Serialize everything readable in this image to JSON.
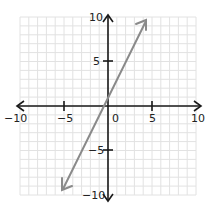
{
  "chart_data": {
    "type": "line",
    "title": "",
    "xlabel": "",
    "ylabel": "",
    "xlim": [
      -10,
      10
    ],
    "ylim": [
      -10,
      10
    ],
    "grid": true,
    "x_ticks": [
      -10,
      -5,
      0,
      5,
      10
    ],
    "y_ticks": [
      -10,
      -5,
      5,
      10
    ],
    "x_tick_labels": [
      "-10",
      "-5",
      "0",
      "5",
      "10"
    ],
    "y_tick_labels": [
      "10",
      "5",
      "-5",
      "-10"
    ],
    "series": [
      {
        "name": "y = 2x + 1",
        "equation": "y = 2x + 1",
        "x": [
          -5.2,
          -0.5,
          0,
          4.4
        ],
        "y": [
          -9.4,
          0,
          1,
          9.8
        ],
        "color": "#8a8a8a",
        "arrows": "both"
      }
    ],
    "axis_color": "#1a1a1a",
    "grid_color": "#e2e2e2"
  },
  "labels": {
    "x_neg10": "−10",
    "x_neg5": "−5",
    "origin": "0",
    "x_5": "5",
    "x_10": "10",
    "y_10": "10",
    "y_5": "5",
    "y_neg5": "−5",
    "y_neg10": "−10"
  }
}
